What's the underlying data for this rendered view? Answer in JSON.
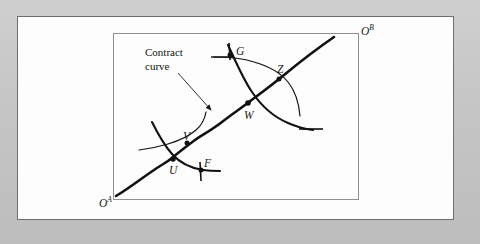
{
  "figure": {
    "kind": "edgeworth-box-contract-curve",
    "background_color": "#c6c6c6",
    "page_color": "#fdfdfd",
    "ink_color": "#1a1a1a",
    "box": {
      "x": 113,
      "y": 33,
      "width": 245,
      "height": 166,
      "stroke": "#8a8a8a"
    },
    "annotation": {
      "text": "Contract\ncurve",
      "x": 145,
      "y": 46,
      "arrow_from": [
        178,
        74
      ],
      "arrow_to": [
        213,
        112
      ]
    },
    "origins": [
      {
        "id": "origin-a",
        "label": "O",
        "superscript": "A",
        "x": 99,
        "y": 198
      },
      {
        "id": "origin-b",
        "label": "O",
        "superscript": "B",
        "x": 360,
        "y": 28
      }
    ],
    "points": [
      {
        "id": "point-g",
        "label": "G",
        "x": 231,
        "y": 53,
        "label_dx": 5,
        "label_dy": -4
      },
      {
        "id": "point-z",
        "label": "Z",
        "x": 279,
        "y": 77,
        "label_dx": -2,
        "label_dy": -7
      },
      {
        "id": "point-w",
        "label": "W",
        "x": 248,
        "y": 103,
        "label_dx": -3,
        "label_dy": 13
      },
      {
        "id": "point-v",
        "label": "V",
        "x": 187,
        "y": 142,
        "label_dx": -3,
        "label_dy": -6
      },
      {
        "id": "point-u",
        "label": "U",
        "x": 173,
        "y": 159,
        "label_dx": -3,
        "label_dy": 12
      },
      {
        "id": "point-f",
        "label": "F",
        "x": 200,
        "y": 169,
        "label_dx": 3,
        "label_dy": -6
      }
    ],
    "curves": {
      "contract_curve": "M 116,196 C 132,186 148,174 162,166 C 168,162 172,160 178,155 C 186,148 192,144 200,138 C 210,131 218,127 226,120 C 234,113 242,108 250,102 C 262,93 272,86 284,76 C 300,63 318,49 334,38",
      "indiff_a_lower": "M 152,122 C 158,134 164,145 172,154 C 180,163 190,168 203,170 C 210,171 215,171 220,171",
      "indiff_b_lower": "M 139,150 C 148,149 158,147 168,144 C 178,141 188,137 196,130 C 202,125 205,118 206,112",
      "indiff_a_upper": "M 228,45 C 236,62 243,79 252,92 C 262,107 274,117 288,123 C 297,127 305,129 313,130",
      "indiff_b_upper": "M 214,57 C 228,57 242,58 254,62 C 268,66 280,72 288,82 C 296,92 299,104 300,116"
    },
    "ticks": {
      "g_tick": "M 228,44 L 229,62",
      "f_tick": "M 200,163 L 201,181",
      "g_left": "M 212,57 L 234,57",
      "z_right": "M 300,129 L 322,129"
    }
  }
}
